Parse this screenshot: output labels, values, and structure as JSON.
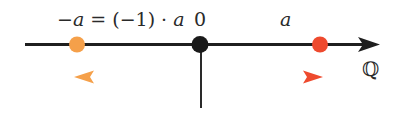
{
  "diagram": {
    "labels": {
      "neg_a_lhs": "−a",
      "equals_expr": " = (−1) · ",
      "neg_a_rhs": "a",
      "zero": "0",
      "a": "a",
      "set": "ℚ"
    },
    "points": [
      {
        "name": "-a",
        "x": 77,
        "color": "#f5a04a"
      },
      {
        "name": "0",
        "x": 200,
        "color": "#1a1a1a"
      },
      {
        "name": "a",
        "x": 320,
        "color": "#ee4a2e"
      }
    ],
    "arrows": [
      {
        "name": "to-neg-a",
        "from_x": 200,
        "to_x": 73,
        "color": "#f5a04a"
      },
      {
        "name": "to-a",
        "from_x": 200,
        "to_x": 323,
        "color": "#ee4a2e"
      }
    ],
    "colors": {
      "axis": "#1f1f1f",
      "orange": "#f5a04a",
      "red": "#ee4a2e"
    }
  }
}
